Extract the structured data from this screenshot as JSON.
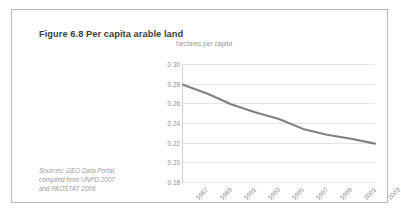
{
  "figure": {
    "title": "Figure 6.8 Per capita arable land",
    "source_lines": [
      "Sources: GEO Data Portal,",
      "compiled from UNPD 2007",
      "and FAOSTAT 2006"
    ]
  },
  "colors": {
    "title": "#3d3d3d",
    "line": "#808080",
    "grid": "#e6e6e6",
    "axis": "#cfcfcf",
    "tick_text": "#8f8f8f",
    "source_text": "#9a9a9a",
    "frame": "#b9b9b9"
  },
  "chart_data": {
    "type": "line",
    "title": "Figure 6.8 Per capita arable land",
    "xlabel": "",
    "ylabel": "hectares per capita",
    "ylim": [
      0.18,
      0.3
    ],
    "ytick_step": 0.02,
    "yticks": [
      "0.30",
      "0.28",
      "0.26",
      "0.24",
      "0.22",
      "0.20",
      "0.18"
    ],
    "categories": [
      "1987",
      "1989",
      "1991",
      "1993",
      "1995",
      "1997",
      "1999",
      "2001",
      "2003"
    ],
    "x": [
      1987,
      1989,
      1991,
      1993,
      1995,
      1997,
      1999,
      2001,
      2003
    ],
    "values": [
      0.279,
      0.27,
      0.259,
      0.251,
      0.244,
      0.234,
      0.228,
      0.224,
      0.219
    ],
    "series": [
      {
        "name": "Per capita arable land",
        "values": [
          0.279,
          0.27,
          0.259,
          0.251,
          0.244,
          0.234,
          0.228,
          0.224,
          0.219
        ]
      }
    ],
    "grid": true,
    "grid_axis": "y",
    "legend": false,
    "legend_position": "none",
    "xtick_rotation": -45
  }
}
